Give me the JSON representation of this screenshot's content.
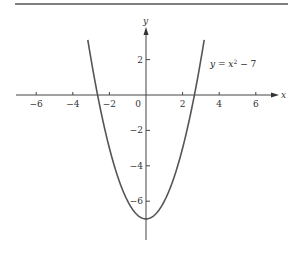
{
  "chart_data": {
    "type": "line",
    "title": "",
    "xlabel": "x",
    "ylabel": "y",
    "xlim": [
      -7,
      7
    ],
    "ylim": [
      -8,
      3
    ],
    "grid": false,
    "x_ticks": [
      -6,
      -4,
      -2,
      0,
      2,
      4,
      6
    ],
    "x_tick_labels": [
      "−6",
      "−4",
      "−2",
      "0",
      "2",
      "4",
      "6"
    ],
    "y_ticks": [
      2,
      -2,
      -4,
      -6
    ],
    "y_tick_labels": [
      "2",
      "−2",
      "−4",
      "−6"
    ],
    "series": [
      {
        "name": "y = x² − 7",
        "function": "x^2 - 7",
        "x": [
          -3.2,
          -3,
          -2.5,
          -2,
          -1.5,
          -1,
          -0.5,
          0,
          0.5,
          1,
          1.5,
          2,
          2.5,
          3,
          3.2
        ],
        "y": [
          3.24,
          2,
          -0.75,
          -3,
          -4.75,
          -6,
          -6.75,
          -7,
          -6.75,
          -6,
          -4.75,
          -3,
          -0.75,
          2,
          3.24
        ]
      }
    ],
    "annotations": [
      {
        "text": "y = x² − 7",
        "position": "right of curve near y=2"
      }
    ]
  },
  "labels": {
    "x_axis": "x",
    "y_axis": "y",
    "equation_var": "y = x",
    "equation_exp": "2",
    "equation_rest": " − 7"
  }
}
